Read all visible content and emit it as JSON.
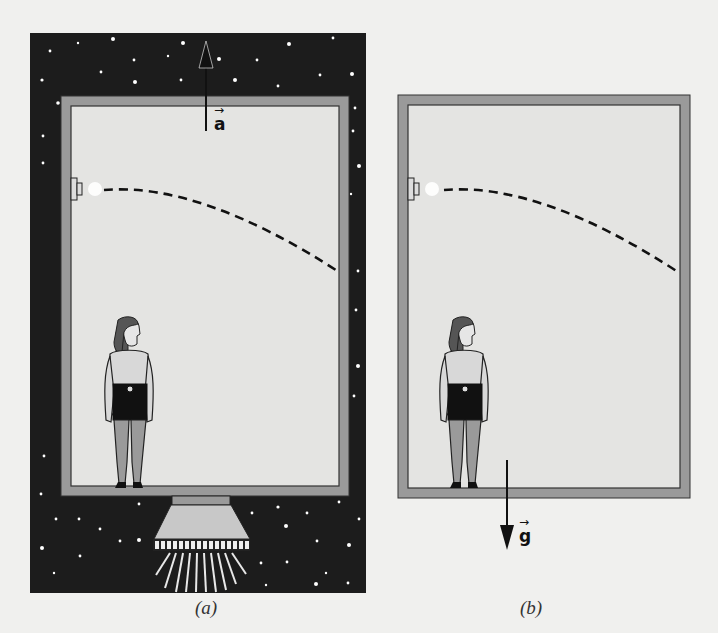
{
  "figure": {
    "panels": [
      {
        "id": "a",
        "caption": "(a)",
        "background": "starfield",
        "vector_label": "a",
        "vector_direction": "up",
        "has_rocket": true
      },
      {
        "id": "b",
        "caption": "(b)",
        "background": "plain",
        "vector_label": "g",
        "vector_direction": "down",
        "has_rocket": false
      }
    ],
    "elements": {
      "projectile_path": "dashed-parabola",
      "launcher": "wall-mounted-cannon",
      "observer": "standing-woman"
    },
    "colors": {
      "space": "#1c1c1c",
      "wall": "#9a9a9a",
      "interior": "#e4e4e2",
      "page": "#f0f0ee",
      "ink": "#111111"
    }
  }
}
